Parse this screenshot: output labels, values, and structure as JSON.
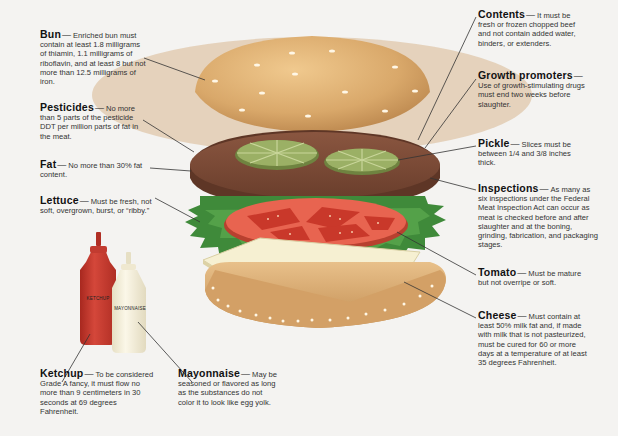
{
  "colors": {
    "background": "#f4f3f1",
    "bun": "#d9a86a",
    "bun_shadow": "#b9884e",
    "patty": "#7a4a36",
    "patty_edge": "#5e3626",
    "pickle": "#8fa35a",
    "lettuce": "#3f8a3a",
    "tomato": "#d9503e",
    "cheese": "#f5efcf",
    "ketchup": "#c8342a",
    "mayonnaise": "#f3edd8",
    "leader_line": "#333333"
  },
  "callouts": {
    "bun": {
      "term": "Bun",
      "dash": "—",
      "text": "Enriched bun must contain at least 1.8 milligrams of thiamin, 1.1 milligrams of riboflavin, and at least 8 but not more than 12.5 milligrams of iron."
    },
    "pesticides": {
      "term": "Pesticides",
      "dash": "—",
      "text": "No more than 5 parts of the pesticide DDT per million parts of fat in the meat."
    },
    "fat": {
      "term": "Fat",
      "dash": "—",
      "text": "No more than 30% fat content."
    },
    "lettuce": {
      "term": "Lettuce",
      "dash": "—",
      "text": "Must be fresh, not soft, overgrown, burst, or “ribby.”"
    },
    "ketchup": {
      "term": "Ketchup",
      "dash": "—",
      "text": "To be considered Grade A fancy, it must flow no more than 9 centimeters in 30 seconds at 69 degrees Fahrenheit."
    },
    "mayonnaise": {
      "term": "Mayonnaise",
      "dash": "—",
      "text": "May be seasoned or flavored as long as the substances do not color it to look like egg yolk."
    },
    "contents": {
      "term": "Contents",
      "dash": "—",
      "text": "It must be fresh or frozen chopped beef and not contain added water, binders, or extenders."
    },
    "growth_promoters": {
      "term": "Growth promoters",
      "dash": "—",
      "text": "Use of growth-stimulating drugs must end two weeks before slaughter."
    },
    "pickle": {
      "term": "Pickle",
      "dash": "—",
      "text": "Slices must be between 1/4 and 3/8 inches thick."
    },
    "inspections": {
      "term": "Inspections",
      "dash": "—",
      "text": "As many as six inspections under the Federal Meat Inspection Act can occur as meat is checked before and after slaughter and at the boning, grinding, fabrication, and packaging stages."
    },
    "tomato": {
      "term": "Tomato",
      "dash": "—",
      "text": "Must be mature but not overripe or soft."
    },
    "cheese": {
      "term": "Cheese",
      "dash": "—",
      "text": "Must contain at least 50% milk fat and, if made with milk that is not pasteurized, must be cured for 60 or more days at a temperature of at least 35 degrees Fahrenheit."
    }
  },
  "bottles": {
    "ketchup_label": "KETCHUP",
    "mayonnaise_label": "MAYONNAISE"
  }
}
